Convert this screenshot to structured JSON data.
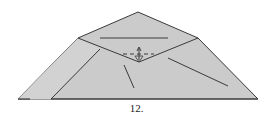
{
  "diagram": {
    "type": "origami-fold-step",
    "step_label": "12.",
    "colors": {
      "paper": "#cbcbcb",
      "line": "#3a3a3a",
      "background": "#ffffff"
    }
  }
}
